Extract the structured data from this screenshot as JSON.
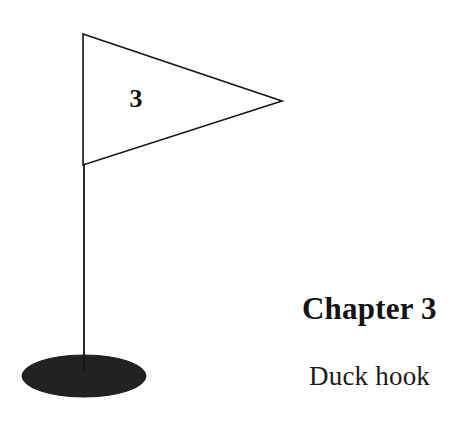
{
  "page": {
    "background_color": "#ffffff",
    "width": 473,
    "height": 429
  },
  "figure": {
    "name": "golf-flag-illustration",
    "stroke_color": "#141414",
    "fill_color": "#ffffff",
    "base_color": "#222222",
    "flag_number": "3",
    "pole": {
      "x": 84,
      "top_y": 34,
      "bottom_y": 372,
      "width": 1.8
    },
    "flag_triangle": {
      "points": "83,34 282,101 83,165",
      "stroke_width": 1.6,
      "filled": false
    },
    "number_position": {
      "x": 136,
      "y": 107
    },
    "base_ellipse": {
      "cx": 84,
      "cy": 376,
      "rx": 62,
      "ry": 21
    }
  },
  "caption": {
    "title": "Chapter 3",
    "subtitle": "Duck hook",
    "title_color": "#131313",
    "subtitle_color": "#1a1a1a"
  }
}
